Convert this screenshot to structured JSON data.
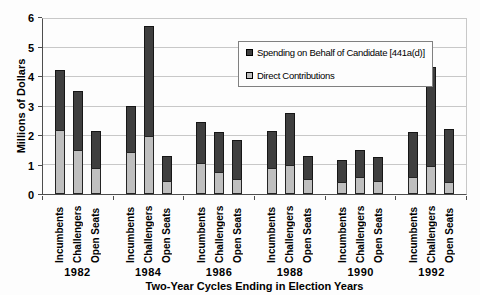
{
  "chart_data": {
    "type": "bar",
    "variant": "grouped-stacked",
    "title": "",
    "ylabel": "Millions of Dollars",
    "xlabel": "Two-Year Cycles Ending in Election Years",
    "ylim": [
      0,
      6
    ],
    "yticks": [
      0,
      1,
      2,
      3,
      4,
      5,
      6
    ],
    "grid": "horizontal",
    "legend_position": "inside-top-right",
    "colors": {
      "spending": "#3f3f3f",
      "direct": "#bfbfbf",
      "gridline": "#c8c8c8",
      "axis": "#4d4d4d"
    },
    "series": [
      {
        "name": "Spending on Behalf of Candidate [441a(d)]",
        "key": "spending_on_behalf",
        "color": "#3f3f3f"
      },
      {
        "name": "Direct Contributions",
        "key": "direct_contributions",
        "color": "#bfbfbf"
      }
    ],
    "bar_categories": [
      "Incumbents",
      "Challengers",
      "Open Seats"
    ],
    "groups": [
      {
        "year": "1982",
        "bars": [
          {
            "label": "Incumbents",
            "direct_contributions": 2.2,
            "spending_on_behalf": 2.1,
            "total": 4.3
          },
          {
            "label": "Challengers",
            "direct_contributions": 1.5,
            "spending_on_behalf": 2.05,
            "total": 3.55
          },
          {
            "label": "Open Seats",
            "direct_contributions": 0.9,
            "spending_on_behalf": 1.3,
            "total": 2.2
          }
        ]
      },
      {
        "year": "1984",
        "bars": [
          {
            "label": "Incumbents",
            "direct_contributions": 1.45,
            "spending_on_behalf": 1.6,
            "total": 3.05
          },
          {
            "label": "Challengers",
            "direct_contributions": 2.0,
            "spending_on_behalf": 3.8,
            "total": 5.8
          },
          {
            "label": "Open Seats",
            "direct_contributions": 0.45,
            "spending_on_behalf": 0.9,
            "total": 1.35
          }
        ]
      },
      {
        "year": "1986",
        "bars": [
          {
            "label": "Incumbents",
            "direct_contributions": 1.05,
            "spending_on_behalf": 1.45,
            "total": 2.5
          },
          {
            "label": "Challengers",
            "direct_contributions": 0.75,
            "spending_on_behalf": 1.4,
            "total": 2.15
          },
          {
            "label": "Open Seats",
            "direct_contributions": 0.5,
            "spending_on_behalf": 1.4,
            "total": 1.9
          }
        ]
      },
      {
        "year": "1988",
        "bars": [
          {
            "label": "Incumbents",
            "direct_contributions": 0.9,
            "spending_on_behalf": 1.3,
            "total": 2.2
          },
          {
            "label": "Challengers",
            "direct_contributions": 1.0,
            "spending_on_behalf": 1.8,
            "total": 2.8
          },
          {
            "label": "Open Seats",
            "direct_contributions": 0.5,
            "spending_on_behalf": 0.85,
            "total": 1.35
          }
        ]
      },
      {
        "year": "1990",
        "bars": [
          {
            "label": "Incumbents",
            "direct_contributions": 0.4,
            "spending_on_behalf": 0.8,
            "total": 1.2
          },
          {
            "label": "Challengers",
            "direct_contributions": 0.6,
            "spending_on_behalf": 0.95,
            "total": 1.55
          },
          {
            "label": "Open Seats",
            "direct_contributions": 0.45,
            "spending_on_behalf": 0.85,
            "total": 1.3
          }
        ]
      },
      {
        "year": "1992",
        "bars": [
          {
            "label": "Incumbents",
            "direct_contributions": 0.6,
            "spending_on_behalf": 1.55,
            "total": 2.15
          },
          {
            "label": "Challengers",
            "direct_contributions": 0.95,
            "spending_on_behalf": 3.45,
            "total": 4.4
          },
          {
            "label": "Open Seats",
            "direct_contributions": 0.4,
            "spending_on_behalf": 1.85,
            "total": 2.25
          }
        ]
      }
    ]
  }
}
